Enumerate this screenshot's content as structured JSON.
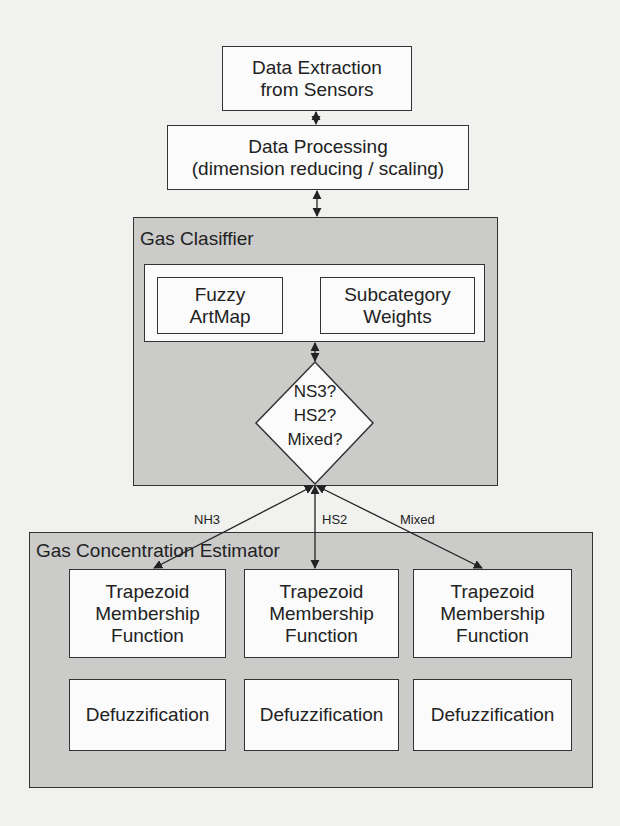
{
  "diagram": {
    "type": "block-flowchart",
    "colors": {
      "background": "#f1f1ef",
      "panel_fill": "#cbcbca",
      "box_fill": "#fbfbfb",
      "stroke": "#333333"
    },
    "nodes": {
      "data_extraction": {
        "label": "Data Extraction\nfrom Sensors"
      },
      "data_processing": {
        "label": "Data Processing\n(dimension reducing / scaling)"
      },
      "gas_classifier": {
        "title": "Gas Clasiffier",
        "fuzzy_artmap": {
          "label": "Fuzzy\nArtMap"
        },
        "subcategory_weights": {
          "label": "Subcategory\nWeights"
        },
        "decision": {
          "lines": [
            "NS3?",
            "HS2?",
            "Mixed?"
          ]
        }
      },
      "gas_concentration_estimator": {
        "title": "Gas Concentration Estimator",
        "membership_functions": [
          {
            "label": "Trapezoid\nMembership\nFunction"
          },
          {
            "label": "Trapezoid\nMembership\nFunction"
          },
          {
            "label": "Trapezoid\nMembership\nFunction"
          }
        ],
        "defuzzification": [
          {
            "label": "Defuzzification"
          },
          {
            "label": "Defuzzification"
          },
          {
            "label": "Defuzzification"
          }
        ]
      }
    },
    "edges": [
      {
        "from": "data_extraction",
        "to": "data_processing",
        "direction": "bidirectional"
      },
      {
        "from": "data_processing",
        "to": "gas_classifier",
        "direction": "bidirectional"
      },
      {
        "from": "classifier_inner",
        "to": "decision",
        "direction": "bidirectional"
      },
      {
        "from": "decision",
        "to": "membership_1",
        "label": "NH3",
        "direction": "bidirectional"
      },
      {
        "from": "decision",
        "to": "membership_2",
        "label": "HS2",
        "direction": "bidirectional"
      },
      {
        "from": "decision",
        "to": "membership_3",
        "label": "Mixed",
        "direction": "bidirectional"
      }
    ],
    "edge_labels": {
      "nh3": "NH3",
      "hs2": "HS2",
      "mixed": "Mixed"
    }
  }
}
